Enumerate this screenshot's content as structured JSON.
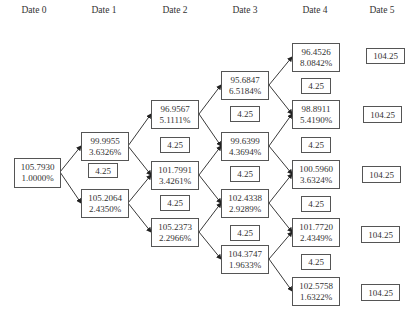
{
  "headers": [
    "Date 0",
    "Date 1",
    "Date 2",
    "Date 3",
    "Date 4",
    "Date 5"
  ],
  "nodes": {
    "d0": [
      {
        "price": "105.7930",
        "rate": "1.0000%"
      }
    ],
    "d1": [
      {
        "price": "99.9955",
        "rate": "3.6326%"
      },
      {
        "price": "105.2064",
        "rate": "2.4350%"
      }
    ],
    "d2": [
      {
        "price": "96.9567",
        "rate": "5.1111%"
      },
      {
        "price": "101.7991",
        "rate": "3.4261%"
      },
      {
        "price": "105.2373",
        "rate": "2.2966%"
      }
    ],
    "d3": [
      {
        "price": "95.6847",
        "rate": "6.5184%"
      },
      {
        "price": "99.6399",
        "rate": "4.3694%"
      },
      {
        "price": "102.4338",
        "rate": "2.9289%"
      },
      {
        "price": "104.3747",
        "rate": "1.9633%"
      }
    ],
    "d4": [
      {
        "price": "96.4526",
        "rate": "8.0842%"
      },
      {
        "price": "98.8911",
        "rate": "5.4190%"
      },
      {
        "price": "100.5960",
        "rate": "3.6324%"
      },
      {
        "price": "101.7720",
        "rate": "2.4349%"
      },
      {
        "price": "102.5758",
        "rate": "1.6322%"
      }
    ],
    "d5": [
      "104.25",
      "104.25",
      "104.25",
      "104.25",
      "104.25"
    ]
  },
  "coupon": "4.25",
  "colors": {
    "border": "#555555",
    "text": "#333333",
    "arrow": "#222222"
  }
}
